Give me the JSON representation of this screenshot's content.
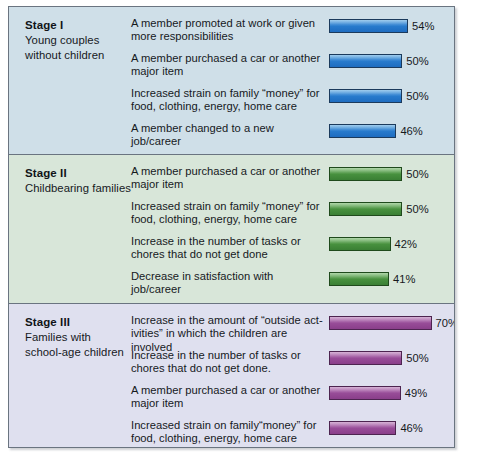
{
  "figure": {
    "border_color": "#6a7480"
  },
  "chart_data": {
    "type": "bar",
    "xlabel": "",
    "ylabel": "",
    "xlim": [
      0,
      100
    ],
    "grid": false,
    "legend": "none",
    "orientation": "horizontal",
    "value_suffix": "%",
    "groups": [
      {
        "id": "stage-1",
        "stage_title": "Stage I",
        "stage_subtitle": "Young couples\nwithout children",
        "background": "#cfdfe8",
        "bar_color": "#2b7fd0",
        "categories": [
          "A member promoted at work or given more responsibilities",
          "A member purchased a car or another major item",
          "Increased strain on family “money” for food, clothing, energy, home care",
          "A member changed to a new job/career"
        ],
        "values": [
          54,
          50,
          50,
          46
        ],
        "labels": [
          "54%",
          "50%",
          "50%",
          "46%"
        ]
      },
      {
        "id": "stage-2",
        "stage_title": "Stage II",
        "stage_subtitle": "Childbearing families",
        "background": "#d8e6d9",
        "bar_color": "#4a9440",
        "categories": [
          "A member purchased a car or another major item",
          "Increased strain on family “money” for food, clothing, energy, home care",
          "Increase in the number of tasks or chores that do not get done",
          "Decrease in satisfaction with job/career"
        ],
        "values": [
          50,
          50,
          42,
          41
        ],
        "labels": [
          "50%",
          "50%",
          "42%",
          "41%"
        ]
      },
      {
        "id": "stage-3",
        "stage_title": "Stage III",
        "stage_subtitle": "Families with\nschool-age children",
        "background": "#dfe0ef",
        "bar_color": "#9b4f9b",
        "categories": [
          "Increase in the amount of “outside act-ivities” in which the children are involved",
          "Increase in the number of tasks or chores that do not get done.",
          "A member purchased a car or another major item",
          "Increased strain on family“money” for food, clothing, energy, home care"
        ],
        "values": [
          70,
          50,
          49,
          46
        ],
        "labels": [
          "70%",
          "50%",
          "49%",
          "46%"
        ]
      }
    ]
  },
  "stages": [
    {
      "title": "Stage I",
      "sub_line1": "Young couples",
      "sub_line2": "without children",
      "rows": [
        {
          "line1": "A member promoted at work or given",
          "line2": "more responsibilities",
          "value": 54,
          "label": "54%"
        },
        {
          "line1": "A member purchased a car or another",
          "line2": "major item",
          "value": 50,
          "label": "50%"
        },
        {
          "line1": "Increased strain on family “money” for",
          "line2": "food, clothing, energy, home care",
          "value": 50,
          "label": "50%"
        },
        {
          "line1": "A member changed to a new",
          "line2": "job/career",
          "value": 46,
          "label": "46%"
        }
      ]
    },
    {
      "title": "Stage II",
      "sub_line1": "Childbearing families",
      "sub_line2": "",
      "rows": [
        {
          "line1": "A member purchased a car or another",
          "line2": "major item",
          "value": 50,
          "label": "50%"
        },
        {
          "line1": "Increased strain on family “money” for",
          "line2": "food, clothing, energy, home care",
          "value": 50,
          "label": "50%"
        },
        {
          "line1": "Increase in the number of tasks or",
          "line2": "chores that do not get done",
          "value": 42,
          "label": "42%"
        },
        {
          "line1": "Decrease in satisfaction with",
          "line2": "job/career",
          "value": 41,
          "label": "41%"
        }
      ]
    },
    {
      "title": "Stage III",
      "sub_line1": "Families with",
      "sub_line2": "school-age children",
      "rows": [
        {
          "line1": "Increase in the amount of “outside act-",
          "line2": "ivities” in which the children are involved",
          "value": 70,
          "label": "70%"
        },
        {
          "line1": "Increase in the number of tasks or",
          "line2": "chores that do not get done.",
          "value": 50,
          "label": "50%"
        },
        {
          "line1": "A member purchased a car or another",
          "line2": "major item",
          "value": 49,
          "label": "49%"
        },
        {
          "line1": "Increased strain on family“money” for",
          "line2": "food, clothing, energy, home care",
          "value": 46,
          "label": "46%"
        }
      ]
    }
  ]
}
